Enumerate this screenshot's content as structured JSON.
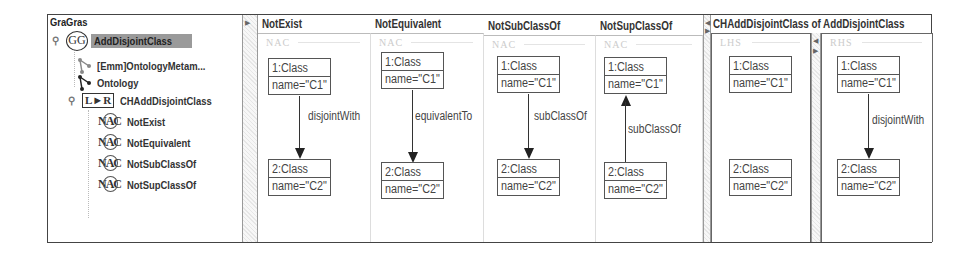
{
  "tree": {
    "title": "GraGras",
    "grammar": {
      "icon": "graph-grammar-icon",
      "icon_text": "GG",
      "label": "AddDisjointClass",
      "selected": true
    },
    "items": [
      {
        "icon": "type-graph-icon",
        "label": "[Emm]OntologyMetam..."
      },
      {
        "icon": "host-graph-icon",
        "label": "Ontology"
      }
    ],
    "rule": {
      "icon": "rule-icon",
      "icon_text": "L►R",
      "label": "CHAddDisjointClass"
    },
    "nacs": [
      {
        "icon": "nac-icon",
        "icon_text": "NAC",
        "label": "NotExist"
      },
      {
        "icon": "nac-icon",
        "icon_text": "NAC",
        "label": "NotEquivalent"
      },
      {
        "icon": "nac-icon",
        "icon_text": "NAC",
        "label": "NotSubClassOf"
      },
      {
        "icon": "nac-icon",
        "icon_text": "NAC",
        "label": "NotSupClassOf"
      }
    ]
  },
  "nac_panels": [
    {
      "title": "NotExist",
      "ghost": "NAC",
      "node1": {
        "head": "1:Class",
        "attr": "name=\"C1\""
      },
      "node2": {
        "head": "2:Class",
        "attr": "name=\"C2\""
      },
      "edge_label": "disjointWith",
      "direction": "down"
    },
    {
      "title": "NotEquivalent",
      "ghost": "NAC",
      "node1": {
        "head": "1:Class",
        "attr": "name=\"C1\""
      },
      "node2": {
        "head": "2:Class",
        "attr": "name=\"C2\""
      },
      "edge_label": "equivalentTo",
      "direction": "down"
    },
    {
      "title": "NotSubClassOf",
      "ghost": "NAC",
      "node1": {
        "head": "1:Class",
        "attr": "name=\"C1\""
      },
      "node2": {
        "head": "2:Class",
        "attr": "name=\"C2\""
      },
      "edge_label": "subClassOf",
      "direction": "down"
    },
    {
      "title": "NotSupClassOf",
      "ghost": "NAC",
      "node1": {
        "head": "1:Class",
        "attr": "name=\"C1\""
      },
      "node2": {
        "head": "2:Class",
        "attr": "name=\"C2\""
      },
      "edge_label": "subClassOf",
      "direction": "up"
    }
  ],
  "rule_panel": {
    "title": "CHAddDisjointClass  of  AddDisjointClass",
    "lhs": {
      "ghost": "LHS",
      "node1": {
        "head": "1:Class",
        "attr": "name=\"C1\""
      },
      "node2": {
        "head": "2:Class",
        "attr": "name=\"C2\""
      }
    },
    "rhs": {
      "ghost": "RHS",
      "node1": {
        "head": "1:Class",
        "attr": "name=\"C1\""
      },
      "node2": {
        "head": "2:Class",
        "attr": "name=\"C2\""
      },
      "edge_label": "disjointWith",
      "direction": "down"
    }
  },
  "colors": {
    "selection": "#9a9a9a",
    "border": "#444444",
    "node_border": "#555555"
  }
}
